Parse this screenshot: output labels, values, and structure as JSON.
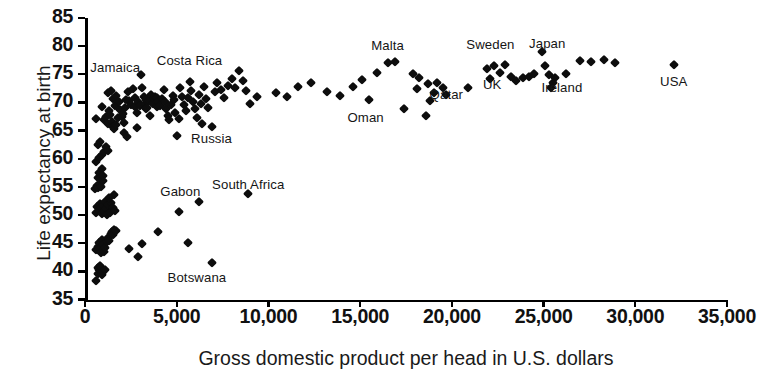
{
  "chart_data": {
    "type": "scatter",
    "title": "",
    "xlabel": "Gross domestic product per head in U.S. dollars",
    "ylabel": "Life expectancy at birth",
    "xlim": [
      0,
      35000
    ],
    "ylim": [
      35,
      85
    ],
    "grid": false,
    "legend": null,
    "xticks": [
      0,
      5000,
      10000,
      15000,
      20000,
      25000,
      30000,
      35000
    ],
    "xticklabels": [
      "0",
      "5,000",
      "10,000",
      "15,000",
      "20,000",
      "25,000",
      "30,000",
      "35,000"
    ],
    "yticks": [
      35,
      40,
      45,
      50,
      55,
      60,
      65,
      70,
      75,
      80,
      85
    ],
    "yticklabels": [
      "35",
      "40",
      "45",
      "50",
      "55",
      "60",
      "65",
      "70",
      "75",
      "80",
      "85"
    ],
    "marker": "diamond",
    "marker_color": "#0d0d0d",
    "points": [
      [
        600,
        38.2
      ],
      [
        700,
        39.6
      ],
      [
        780,
        40.2
      ],
      [
        700,
        40.6
      ],
      [
        850,
        40.0
      ],
      [
        900,
        39.4
      ],
      [
        950,
        40.4
      ],
      [
        1000,
        39.8
      ],
      [
        820,
        41.0
      ],
      [
        1080,
        40.2
      ],
      [
        620,
        43.8
      ],
      [
        700,
        44.4
      ],
      [
        760,
        45.0
      ],
      [
        800,
        44.0
      ],
      [
        880,
        43.2
      ],
      [
        900,
        45.6
      ],
      [
        980,
        44.6
      ],
      [
        1050,
        43.4
      ],
      [
        1100,
        44.2
      ],
      [
        1180,
        45.2
      ],
      [
        1250,
        46.0
      ],
      [
        1320,
        45.4
      ],
      [
        1400,
        46.6
      ],
      [
        1480,
        47.0
      ],
      [
        1550,
        46.4
      ],
      [
        1600,
        47.4
      ],
      [
        1700,
        47.2
      ],
      [
        2400,
        44.0
      ],
      [
        2900,
        42.6
      ],
      [
        3100,
        44.8
      ],
      [
        4000,
        47.0
      ],
      [
        5100,
        50.6
      ],
      [
        5600,
        45.0
      ],
      [
        6200,
        52.4
      ],
      [
        6900,
        41.4
      ],
      [
        8900,
        53.8
      ],
      [
        600,
        50.4
      ],
      [
        680,
        51.4
      ],
      [
        760,
        50.8
      ],
      [
        800,
        52.0
      ],
      [
        860,
        51.2
      ],
      [
        900,
        50.2
      ],
      [
        960,
        51.6
      ],
      [
        1020,
        50.6
      ],
      [
        1100,
        52.4
      ],
      [
        1150,
        51.0
      ],
      [
        1200,
        50.0
      ],
      [
        1280,
        51.8
      ],
      [
        1350,
        50.4
      ],
      [
        1420,
        52.2
      ],
      [
        1500,
        51.2
      ],
      [
        1560,
        53.6
      ],
      [
        1620,
        50.8
      ],
      [
        1300,
        53.0
      ],
      [
        560,
        54.6
      ],
      [
        640,
        55.2
      ],
      [
        720,
        54.8
      ],
      [
        800,
        55.6
      ],
      [
        880,
        55.0
      ],
      [
        960,
        56.0
      ],
      [
        700,
        56.6
      ],
      [
        780,
        57.4
      ],
      [
        900,
        58.2
      ],
      [
        1000,
        57.0
      ],
      [
        620,
        59.4
      ],
      [
        760,
        60.2
      ],
      [
        900,
        60.6
      ],
      [
        1040,
        61.2
      ],
      [
        1150,
        62.0
      ],
      [
        1250,
        61.4
      ],
      [
        700,
        62.4
      ],
      [
        820,
        63.0
      ],
      [
        600,
        67.0
      ],
      [
        900,
        69.2
      ],
      [
        1050,
        66.8
      ],
      [
        1150,
        67.4
      ],
      [
        1250,
        66.2
      ],
      [
        1350,
        67.8
      ],
      [
        1450,
        66.6
      ],
      [
        1300,
        68.4
      ],
      [
        1500,
        65.6
      ],
      [
        1600,
        65.2
      ],
      [
        1700,
        66.0
      ],
      [
        1800,
        67.2
      ],
      [
        1250,
        71.6
      ],
      [
        1400,
        72.0
      ],
      [
        1550,
        70.6
      ],
      [
        1700,
        71.2
      ],
      [
        1620,
        69.4
      ],
      [
        1850,
        70.0
      ],
      [
        1900,
        68.6
      ],
      [
        2000,
        67.4
      ],
      [
        2100,
        66.4
      ],
      [
        2050,
        68.0
      ],
      [
        2200,
        69.0
      ],
      [
        2250,
        70.4
      ],
      [
        2350,
        71.8
      ],
      [
        2400,
        70.2
      ],
      [
        2500,
        69.6
      ],
      [
        2150,
        64.6
      ],
      [
        2300,
        63.8
      ],
      [
        2600,
        72.4
      ],
      [
        2700,
        70.8
      ],
      [
        2750,
        69.2
      ],
      [
        2850,
        68.2
      ],
      [
        2900,
        70.0
      ],
      [
        3000,
        69.4
      ],
      [
        2850,
        65.4
      ],
      [
        3050,
        74.8
      ],
      [
        3100,
        72.6
      ],
      [
        3200,
        71.0
      ],
      [
        3250,
        69.8
      ],
      [
        3300,
        68.8
      ],
      [
        3350,
        70.4
      ],
      [
        3400,
        69.0
      ],
      [
        3500,
        70.2
      ],
      [
        3550,
        67.6
      ],
      [
        3600,
        71.4
      ],
      [
        3700,
        69.8
      ],
      [
        3750,
        70.6
      ],
      [
        3800,
        71.0
      ],
      [
        3900,
        69.2
      ],
      [
        3950,
        70.8
      ],
      [
        4000,
        70.0
      ],
      [
        4100,
        69.4
      ],
      [
        4200,
        70.6
      ],
      [
        4300,
        72.2
      ],
      [
        4350,
        70.0
      ],
      [
        4400,
        68.8
      ],
      [
        4500,
        67.6
      ],
      [
        4600,
        66.8
      ],
      [
        4700,
        69.6
      ],
      [
        4800,
        71.2
      ],
      [
        4850,
        70.4
      ],
      [
        4900,
        68.2
      ],
      [
        5000,
        64.0
      ],
      [
        5100,
        67.0
      ],
      [
        5200,
        72.6
      ],
      [
        5300,
        71.0
      ],
      [
        5400,
        69.6
      ],
      [
        5500,
        68.4
      ],
      [
        5600,
        70.8
      ],
      [
        5700,
        73.6
      ],
      [
        5800,
        72.0
      ],
      [
        5900,
        70.0
      ],
      [
        6000,
        68.8
      ],
      [
        6100,
        67.2
      ],
      [
        6200,
        71.4
      ],
      [
        6300,
        69.8
      ],
      [
        6400,
        66.2
      ],
      [
        6500,
        72.8
      ],
      [
        6600,
        70.6
      ],
      [
        6700,
        69.0
      ],
      [
        6900,
        65.6
      ],
      [
        7100,
        71.8
      ],
      [
        7200,
        73.4
      ],
      [
        7400,
        72.2
      ],
      [
        7600,
        70.8
      ],
      [
        7800,
        73.0
      ],
      [
        8000,
        74.2
      ],
      [
        8200,
        72.6
      ],
      [
        8400,
        75.6
      ],
      [
        8600,
        73.8
      ],
      [
        8800,
        72.0
      ],
      [
        9000,
        69.8
      ],
      [
        9400,
        71.0
      ],
      [
        10400,
        71.6
      ],
      [
        11000,
        71.0
      ],
      [
        11600,
        72.8
      ],
      [
        12300,
        73.4
      ],
      [
        13200,
        71.8
      ],
      [
        13900,
        71.2
      ],
      [
        14600,
        72.8
      ],
      [
        15100,
        74.0
      ],
      [
        15500,
        70.4
      ],
      [
        15900,
        75.2
      ],
      [
        16500,
        77.0
      ],
      [
        16900,
        77.2
      ],
      [
        17400,
        68.8
      ],
      [
        17900,
        75.0
      ],
      [
        18200,
        74.4
      ],
      [
        18100,
        72.4
      ],
      [
        18700,
        73.2
      ],
      [
        19200,
        73.4
      ],
      [
        19500,
        72.6
      ],
      [
        19000,
        71.6
      ],
      [
        19700,
        71.4
      ],
      [
        18600,
        67.6
      ],
      [
        20900,
        72.6
      ],
      [
        21900,
        76.0
      ],
      [
        22100,
        74.2
      ],
      [
        22300,
        76.4
      ],
      [
        22600,
        75.2
      ],
      [
        22900,
        76.6
      ],
      [
        23200,
        74.6
      ],
      [
        23500,
        73.8
      ],
      [
        23900,
        74.4
      ],
      [
        24200,
        74.6
      ],
      [
        24500,
        75.0
      ],
      [
        24900,
        79.0
      ],
      [
        25100,
        76.4
      ],
      [
        25300,
        74.8
      ],
      [
        25600,
        74.4
      ],
      [
        25400,
        72.6
      ],
      [
        25500,
        73.4
      ],
      [
        26200,
        75.0
      ],
      [
        27000,
        77.4
      ],
      [
        27600,
        77.2
      ],
      [
        28300,
        77.6
      ],
      [
        28900,
        77.0
      ],
      [
        32100,
        76.6
      ],
      [
        18800,
        70.2
      ]
    ],
    "annotations": [
      {
        "label": "Jamaica",
        "x": 1650,
        "y": 76.3
      },
      {
        "label": "Costa Rica",
        "x": 5700,
        "y": 77.5
      },
      {
        "label": "Russia",
        "x": 6900,
        "y": 63.6
      },
      {
        "label": "Gabon",
        "x": 5200,
        "y": 54.3
      },
      {
        "label": "South Africa",
        "x": 8900,
        "y": 55.5
      },
      {
        "label": "Botswana",
        "x": 6100,
        "y": 39.0
      },
      {
        "label": "Malta",
        "x": 16500,
        "y": 80.2
      },
      {
        "label": "Oman",
        "x": 15300,
        "y": 67.5
      },
      {
        "label": "Qatar",
        "x": 19700,
        "y": 71.5
      },
      {
        "label": "Sweden",
        "x": 22100,
        "y": 80.4
      },
      {
        "label": "UK",
        "x": 22200,
        "y": 73.3
      },
      {
        "label": "Japan",
        "x": 25200,
        "y": 80.5
      },
      {
        "label": "Ireland",
        "x": 26000,
        "y": 72.8
      },
      {
        "label": "USA",
        "x": 32100,
        "y": 73.8
      }
    ]
  },
  "axes": {
    "y_title": "Life expectancy at birth",
    "x_title": "Gross domestic product per head in U.S. dollars"
  }
}
